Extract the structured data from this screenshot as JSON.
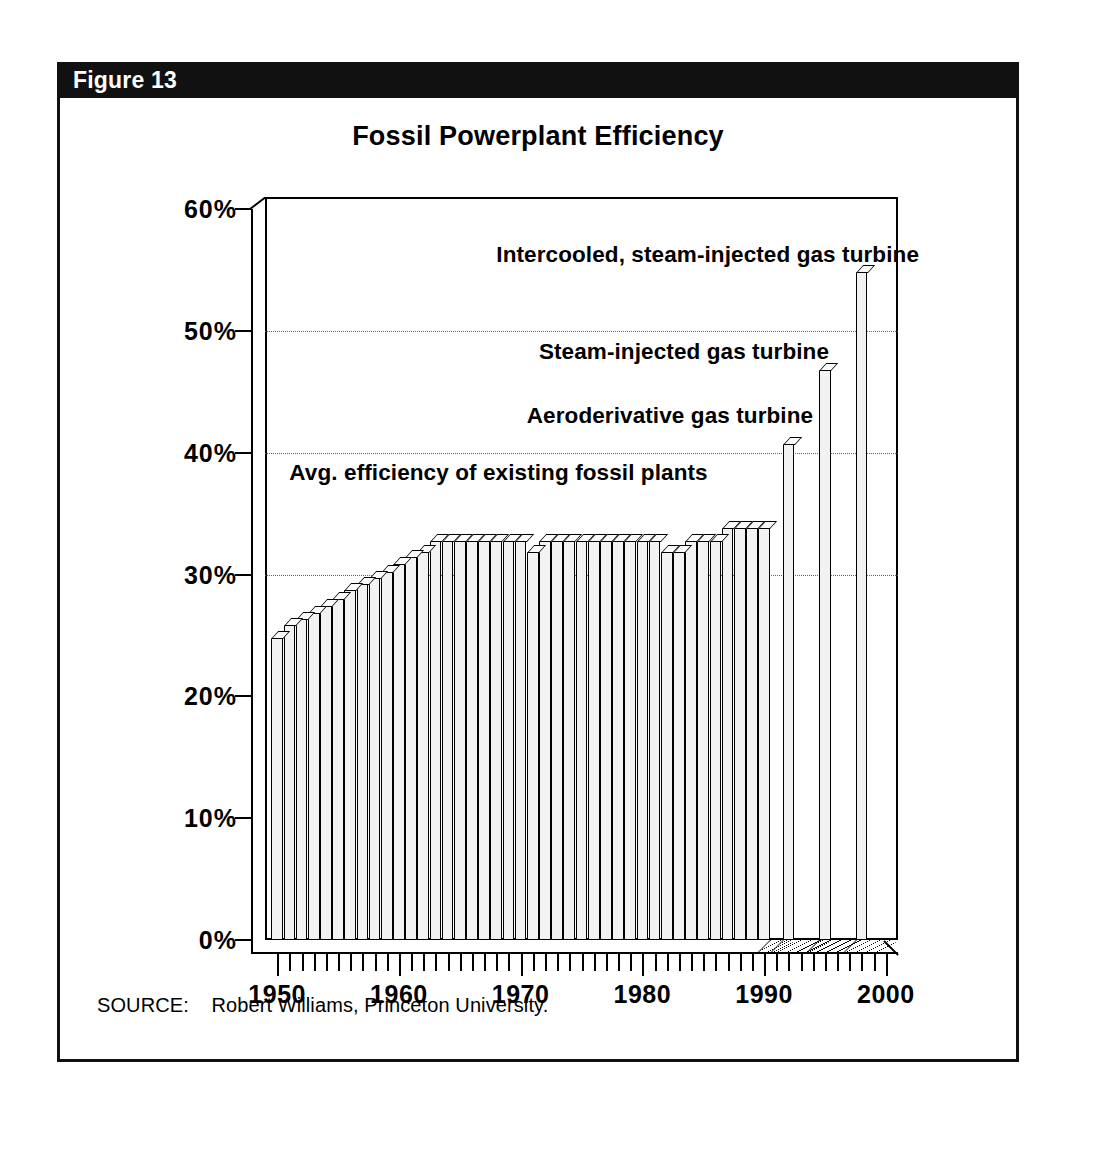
{
  "figure": {
    "number_label": "Figure 13",
    "source_label": "SOURCE:",
    "source_text": "Robert Williams, Princeton University.",
    "banner_color": "#111111",
    "bar_fill_color": "#f2f2f2",
    "ink_color": "#000000"
  },
  "chart_data": {
    "type": "bar",
    "title": "Fossil Powerplant Efficiency",
    "xlabel": "",
    "ylabel": "",
    "ylim": [
      0,
      60
    ],
    "xlim": [
      1949,
      2001
    ],
    "grid": "horizontal-dotted",
    "legend": "none",
    "ytick_labels": [
      "0%",
      "10%",
      "20%",
      "30%",
      "40%",
      "50%",
      "60%"
    ],
    "ytick_values": [
      0,
      10,
      20,
      30,
      40,
      50,
      60
    ],
    "xtick_labels": [
      "1950",
      "1960",
      "1970",
      "1980",
      "1990",
      "2000"
    ],
    "xtick_values": [
      1950,
      1960,
      1970,
      1980,
      1990,
      2000
    ],
    "series": [
      {
        "name": "Avg. efficiency of existing fossil plants",
        "x": [
          1950,
          1951,
          1952,
          1953,
          1954,
          1955,
          1956,
          1957,
          1958,
          1959,
          1960,
          1961,
          1962,
          1963,
          1964,
          1965,
          1966,
          1967,
          1968,
          1969,
          1970,
          1971,
          1972,
          1973,
          1974,
          1975,
          1976,
          1977,
          1978,
          1979,
          1980,
          1981,
          1982,
          1983,
          1984,
          1985,
          1986,
          1987,
          1988,
          1989,
          1990
        ],
        "values": [
          25.4,
          26.4,
          26.9,
          27.4,
          28.0,
          28.6,
          29.3,
          29.8,
          30.3,
          30.8,
          31.4,
          32.0,
          32.4,
          33.3,
          33.3,
          33.3,
          33.3,
          33.3,
          33.3,
          33.3,
          33.3,
          32.4,
          33.3,
          33.3,
          33.3,
          33.3,
          33.3,
          33.3,
          33.3,
          33.3,
          33.3,
          33.3,
          32.4,
          32.4,
          33.3,
          33.3,
          33.3,
          34.4,
          34.4,
          34.4,
          34.4
        ]
      },
      {
        "name": "Aeroderivative gas turbine",
        "x": [
          1992
        ],
        "values": [
          41.3
        ]
      },
      {
        "name": "Steam-injected gas turbine",
        "x": [
          1995
        ],
        "values": [
          47.4
        ]
      },
      {
        "name": "Intercooled, steam-injected gas turbine",
        "x": [
          1998
        ],
        "values": [
          55.4
        ]
      }
    ],
    "annotations": [
      {
        "text": "Intercooled, steam-injected gas turbine",
        "x": 1968.0,
        "y": 56.2
      },
      {
        "text": "Steam-injected gas turbine",
        "x": 1971.5,
        "y": 48.3
      },
      {
        "text": "Aeroderivative gas turbine",
        "x": 1970.5,
        "y": 43.0
      },
      {
        "text": "Avg. efficiency of existing fossil plants",
        "x": 1951.0,
        "y": 38.3
      }
    ]
  }
}
